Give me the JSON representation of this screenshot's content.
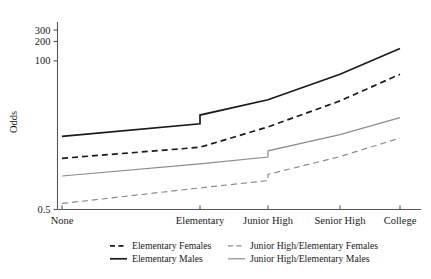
{
  "chart_data": {
    "type": "line",
    "title": "",
    "xlabel": "",
    "ylabel": "Odds",
    "yscale": "log",
    "ylim": [
      0.5,
      400
    ],
    "grid": false,
    "legend_position": "bottom",
    "categories": [
      "None",
      "Elementary",
      "Junior High",
      "Senior High",
      "College"
    ],
    "ytick_labels": [
      "300",
      "200",
      "100",
      "0.5"
    ],
    "ytick_values": [
      300,
      200,
      100,
      0.5
    ],
    "series": [
      {
        "name": "Elementary Females",
        "style": "dashed",
        "color": "#1a1a1a",
        "x": [
          "None",
          "Elementary",
          "Elementary",
          "Junior High",
          "Senior High",
          "College"
        ],
        "values": [
          3.1,
          4.6,
          4.6,
          9.5,
          24.0,
          62.0
        ]
      },
      {
        "name": "Elementary  Males",
        "style": "solid",
        "color": "#1a1a1a",
        "x": [
          "None",
          "Elementary",
          "Elementary",
          "Junior High",
          "Senior High",
          "College"
        ],
        "values": [
          6.8,
          10.6,
          14.5,
          25.0,
          62.0,
          155.0
        ]
      },
      {
        "name": "Junior High/Elementary Females",
        "style": "dashed",
        "color": "#8c8c8c",
        "x": [
          "None",
          "Elementary",
          "Junior High",
          "Junior High",
          "Senior High",
          "College"
        ],
        "values": [
          0.62,
          1.08,
          1.4,
          1.75,
          3.3,
          6.4
        ]
      },
      {
        "name": "Junior High/Elementary Males",
        "style": "solid",
        "color": "#8c8c8c",
        "x": [
          "None",
          "Elementary",
          "Junior High",
          "Junior High",
          "Senior High",
          "College"
        ],
        "values": [
          1.65,
          2.55,
          3.25,
          4.05,
          7.2,
          13.2
        ]
      }
    ],
    "legend": [
      {
        "label": "Elementary Females",
        "style": "dashed",
        "color": "#1a1a1a"
      },
      {
        "label": "Junior High/Elementary Females",
        "style": "dashed",
        "color": "#8c8c8c"
      },
      {
        "label": "Elementary  Males",
        "style": "solid",
        "color": "#1a1a1a"
      },
      {
        "label": "Junior High/Elementary Males",
        "style": "solid",
        "color": "#8c8c8c"
      }
    ]
  }
}
